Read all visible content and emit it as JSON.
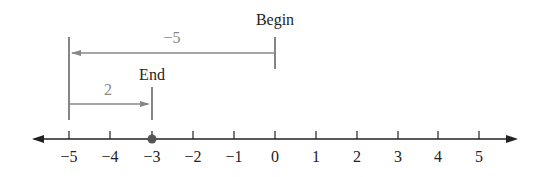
{
  "diagram": {
    "type": "number-line",
    "ticks": [
      "−5",
      "−4",
      "−3",
      "−2",
      "−1",
      "0",
      "1",
      "2",
      "3",
      "4",
      "5"
    ],
    "point": {
      "value": -3,
      "color": "#555555"
    },
    "begin_label": "Begin",
    "end_label": "End",
    "arrows": [
      {
        "from": 0,
        "to": -5,
        "label": "−5"
      },
      {
        "from": -5,
        "to": -3,
        "label": "2"
      }
    ],
    "colors": {
      "axis": "#222222",
      "arrow": "#888888"
    }
  }
}
